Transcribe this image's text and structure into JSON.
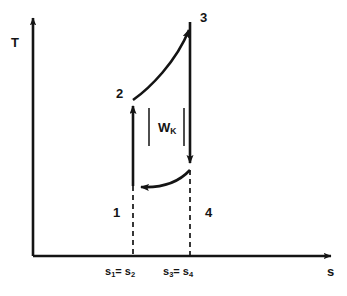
{
  "figure": {
    "kind": "t-s-diagram",
    "background_color": "#ffffff",
    "stroke_color": "#141414"
  },
  "axes": {
    "y_label": "T",
    "x_label": "s",
    "origin": {
      "x": 33,
      "y": 256
    },
    "x_end": {
      "x": 335,
      "y": 256
    },
    "y_end": {
      "x": 33,
      "y": 14
    }
  },
  "states": [
    {
      "id": "1",
      "label": "1",
      "x": 133,
      "y": 186,
      "label_x": 113,
      "label_y": 206
    },
    {
      "id": "2",
      "label": "2",
      "x": 133,
      "y": 100,
      "label_x": 116,
      "label_y": 87
    },
    {
      "id": "3",
      "label": "3",
      "x": 190,
      "y": 22,
      "label_x": 200,
      "label_y": 11
    },
    {
      "id": "4",
      "label": "4",
      "x": 190,
      "y": 170,
      "label_x": 205,
      "label_y": 206
    }
  ],
  "processes": [
    {
      "from": "1",
      "to": "2",
      "shape": "straight",
      "direction": "up",
      "arrow_at": "2"
    },
    {
      "from": "2",
      "to": "3",
      "shape": "curve",
      "direction": "up-right",
      "arrow_at": "3"
    },
    {
      "from": "3",
      "to": "4",
      "shape": "straight",
      "direction": "down",
      "arrow_at": "4"
    },
    {
      "from": "4",
      "to": "1",
      "shape": "curve",
      "direction": "down-left",
      "arrow_at": "1"
    }
  ],
  "annotations": {
    "work": {
      "text": "W",
      "subscript": "K",
      "left_bar": "|",
      "right_bar": "|",
      "x": 152,
      "y": 121
    }
  },
  "ticks": [
    {
      "text_a": "s",
      "sub_a": "1",
      "eq": "= ",
      "text_b": "s",
      "sub_b": "2",
      "x": 133,
      "label_y": 266
    },
    {
      "text_a": "s",
      "sub_a": "3",
      "eq": "= ",
      "text_b": "s",
      "sub_b": "4",
      "x": 190,
      "label_y": 266
    }
  ],
  "guides": [
    {
      "x": 133,
      "y_top": 186,
      "y_bottom": 256,
      "style": "dashed"
    },
    {
      "x": 190,
      "y_top": 170,
      "y_bottom": 256,
      "style": "dashed"
    }
  ]
}
